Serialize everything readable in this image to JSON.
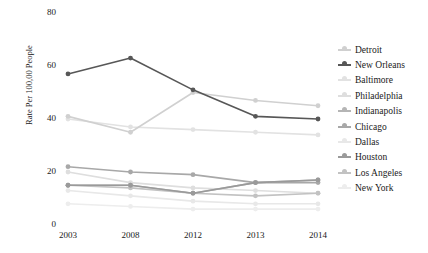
{
  "chart_data": {
    "type": "line",
    "title": "",
    "xlabel": "",
    "ylabel": "Rate Per 100,00 People",
    "categories": [
      "2003",
      "2008",
      "2012",
      "2013",
      "2014"
    ],
    "ylim": [
      0,
      80
    ],
    "yticks": [
      0,
      20,
      40,
      60,
      80
    ],
    "grid": false,
    "legend_position": "right",
    "series": [
      {
        "name": "Detroit",
        "color": "#d0d0d0",
        "values": [
          41,
          35,
          50,
          47,
          45
        ]
      },
      {
        "name": "New Orleans",
        "color": "#575757",
        "values": [
          57,
          63,
          51,
          41,
          40
        ]
      },
      {
        "name": "Baltimore",
        "color": "#e2e2e2",
        "values": [
          40,
          37,
          36,
          35,
          34
        ]
      },
      {
        "name": "Philadelphia",
        "color": "#dedede",
        "values": [
          20,
          16,
          14,
          13,
          12
        ]
      },
      {
        "name": "Indianapolis",
        "color": "#b5b5b5",
        "values": [
          15,
          15,
          12,
          16,
          17
        ]
      },
      {
        "name": "Chicago",
        "color": "#a8a8a8",
        "values": [
          22,
          20,
          19,
          16,
          16
        ]
      },
      {
        "name": "Dallas",
        "color": "#e8e8e8",
        "values": [
          13,
          11,
          9,
          8,
          8
        ]
      },
      {
        "name": "Houston",
        "color": "#9a9a9a",
        "values": [
          15,
          15,
          12,
          16,
          17
        ]
      },
      {
        "name": "Los Angeles",
        "color": "#c2c2c2",
        "values": [
          15,
          14,
          12,
          11,
          12
        ]
      },
      {
        "name": "New York",
        "color": "#ededed",
        "values": [
          8,
          7,
          6,
          6,
          6
        ]
      }
    ]
  },
  "axis": {
    "y_title": "Rate Per 100,00 People",
    "y_ticks": [
      "80",
      "60",
      "40",
      "20",
      "0"
    ],
    "x_ticks": [
      "2003",
      "2008",
      "2012",
      "2013",
      "2014"
    ]
  },
  "legend": {
    "items": [
      {
        "label": "Detroit"
      },
      {
        "label": "New Orleans"
      },
      {
        "label": "Baltimore"
      },
      {
        "label": "Philadelphia"
      },
      {
        "label": "Indianapolis"
      },
      {
        "label": "Chicago"
      },
      {
        "label": "Dallas"
      },
      {
        "label": "Houston"
      },
      {
        "label": "Los Angeles"
      },
      {
        "label": "New York"
      }
    ]
  }
}
